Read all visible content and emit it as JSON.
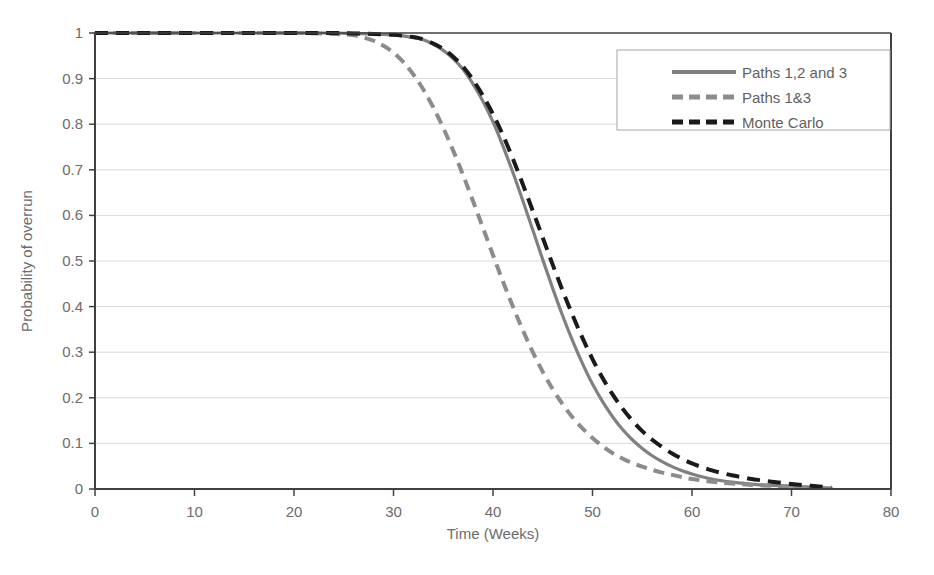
{
  "chart_data": {
    "type": "line",
    "title": "",
    "xlabel": "Time (Weeks)",
    "ylabel": "Probability of overrun",
    "xlim": [
      0,
      80
    ],
    "ylim": [
      0,
      1
    ],
    "xticks": [
      0,
      10,
      20,
      30,
      40,
      50,
      60,
      70,
      80
    ],
    "xtick_labels": [
      "0",
      "10",
      "20",
      "30",
      "40",
      "50",
      "60",
      "70",
      "80"
    ],
    "yticks": [
      0,
      0.1,
      0.2,
      0.3,
      0.4,
      0.5,
      0.6,
      0.7,
      0.8,
      0.9,
      1
    ],
    "ytick_labels": [
      "0",
      "0.1",
      "0.2",
      "0.3",
      "0.4",
      "0.5",
      "0.6",
      "0.7",
      "0.8",
      "0.9",
      "1"
    ],
    "grid": "horizontal",
    "legend_position": "upper-right",
    "series": [
      {
        "name": "Paths 1,2 and 3",
        "style": "solid",
        "color": "#808080",
        "x": [
          0,
          5,
          10,
          15,
          20,
          24,
          26,
          28,
          30,
          32,
          33,
          34,
          35,
          36,
          37,
          38,
          39,
          40,
          41,
          42,
          43,
          44,
          45,
          46,
          47,
          48,
          49,
          50,
          51,
          52,
          53,
          54,
          55,
          56,
          57,
          58,
          59,
          60,
          61,
          62,
          63,
          64,
          65,
          66,
          67,
          68,
          70,
          72,
          74
        ],
        "y": [
          1,
          1,
          1,
          1,
          1,
          1,
          0.999,
          0.998,
          0.996,
          0.99,
          0.985,
          0.975,
          0.962,
          0.944,
          0.92,
          0.888,
          0.85,
          0.805,
          0.752,
          0.694,
          0.632,
          0.568,
          0.503,
          0.44,
          0.38,
          0.325,
          0.275,
          0.23,
          0.192,
          0.159,
          0.131,
          0.108,
          0.089,
          0.073,
          0.06,
          0.049,
          0.04,
          0.033,
          0.027,
          0.022,
          0.018,
          0.015,
          0.013,
          0.011,
          0.009,
          0.008,
          0.006,
          0.004,
          0.002
        ]
      },
      {
        "name": "Paths 1&3",
        "style": "dashed",
        "color": "#8c8c8c",
        "x": [
          0,
          5,
          10,
          15,
          20,
          23,
          25,
          26,
          27,
          28,
          29,
          30,
          31,
          32,
          33,
          34,
          35,
          36,
          37,
          38,
          39,
          40,
          41,
          42,
          43,
          44,
          45,
          46,
          47,
          48,
          49,
          50,
          51,
          52,
          53,
          54,
          55,
          56,
          57,
          58,
          59,
          60,
          62,
          64,
          66,
          68,
          70,
          72,
          74
        ],
        "y": [
          1,
          1,
          1,
          1,
          1,
          0.999,
          0.997,
          0.995,
          0.99,
          0.983,
          0.972,
          0.957,
          0.936,
          0.909,
          0.876,
          0.837,
          0.792,
          0.742,
          0.688,
          0.631,
          0.572,
          0.513,
          0.455,
          0.4,
          0.348,
          0.3,
          0.257,
          0.219,
          0.186,
          0.157,
          0.133,
          0.112,
          0.094,
          0.079,
          0.067,
          0.057,
          0.049,
          0.042,
          0.036,
          0.031,
          0.026,
          0.022,
          0.016,
          0.012,
          0.009,
          0.007,
          0.005,
          0.003,
          0.002
        ]
      },
      {
        "name": "Monte Carlo",
        "style": "dashed",
        "color": "#1a1a1a",
        "x": [
          0,
          5,
          10,
          15,
          20,
          24,
          26,
          28,
          30,
          32,
          33,
          34,
          35,
          36,
          37,
          38,
          39,
          40,
          41,
          42,
          43,
          44,
          45,
          46,
          47,
          48,
          49,
          50,
          51,
          52,
          53,
          54,
          55,
          56,
          57,
          58,
          59,
          60,
          61,
          62,
          63,
          64,
          65,
          66,
          67,
          68,
          70,
          72,
          74
        ],
        "y": [
          1,
          1,
          1,
          1,
          1,
          1,
          0.999,
          0.998,
          0.996,
          0.991,
          0.986,
          0.977,
          0.965,
          0.948,
          0.926,
          0.897,
          0.862,
          0.822,
          0.776,
          0.724,
          0.668,
          0.61,
          0.551,
          0.492,
          0.435,
          0.381,
          0.331,
          0.285,
          0.244,
          0.208,
          0.177,
          0.15,
          0.127,
          0.108,
          0.092,
          0.078,
          0.066,
          0.056,
          0.048,
          0.041,
          0.035,
          0.03,
          0.026,
          0.022,
          0.019,
          0.016,
          0.011,
          0.007,
          0.003
        ]
      }
    ]
  },
  "legend": {
    "entries": [
      {
        "label": "Paths 1,2 and 3"
      },
      {
        "label": "Paths 1&3"
      },
      {
        "label": "Monte Carlo"
      }
    ]
  },
  "colors": {
    "grid": "#d9d9d9",
    "axis": "#404040",
    "text": "#6b6b6b",
    "legend_border": "#a6a6a6",
    "background": "#ffffff"
  }
}
